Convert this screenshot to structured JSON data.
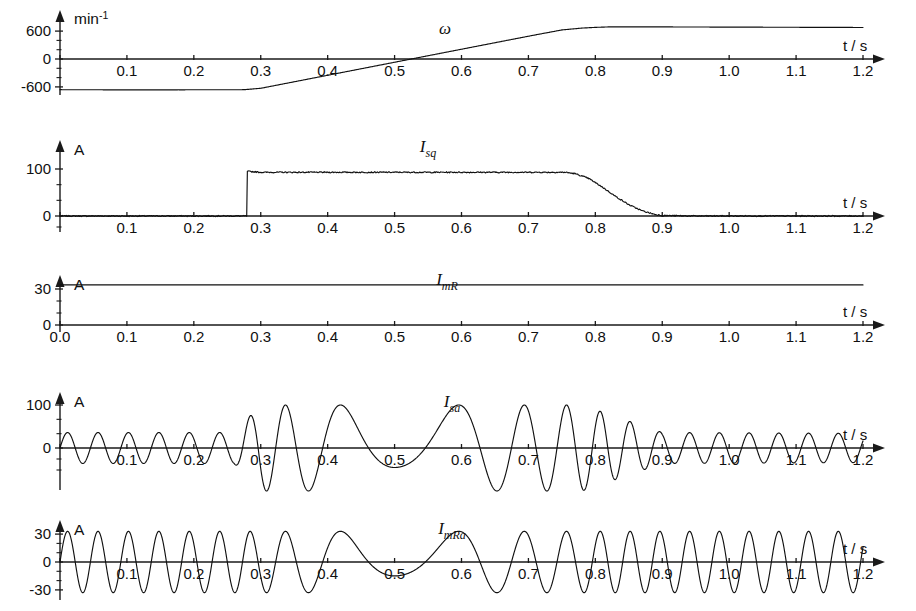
{
  "figure": {
    "background_color": "#ffffff",
    "trace_color": "#111111",
    "axis_color": "#1a1a1a"
  },
  "chart_data": [
    {
      "type": "line",
      "panel_index": 0,
      "name": "speed",
      "curve_label": "ω",
      "title": "",
      "ylabel": "min-1",
      "ylabel_unit": "min",
      "ylabel_exponent": "-1",
      "xlabel": "t / s",
      "xlim": [
        0.0,
        1.2
      ],
      "ylim": [
        -900,
        900
      ],
      "xticks": [
        0.0,
        0.1,
        0.2,
        0.3,
        0.4,
        0.5,
        0.6,
        0.7,
        0.8,
        0.9,
        1.0,
        1.1,
        1.2
      ],
      "xticklabels": [
        "",
        "0.1",
        "0.2",
        "0.3",
        "0.4",
        "0.5",
        "0.6",
        "0.7",
        "0.8",
        "0.9",
        "1.0",
        "1.1",
        "1.2"
      ],
      "yticks": [
        -600,
        0,
        600
      ],
      "yticklabels": [
        "-600",
        "0",
        "600"
      ],
      "grid": false,
      "x": [
        0.0,
        0.05,
        0.1,
        0.15,
        0.2,
        0.25,
        0.275,
        0.3,
        0.35,
        0.4,
        0.45,
        0.5,
        0.55,
        0.6,
        0.65,
        0.7,
        0.75,
        0.78,
        0.8,
        0.82,
        0.85,
        0.9,
        0.95,
        1.0,
        1.05,
        1.1,
        1.15,
        1.2
      ],
      "values": [
        -660,
        -662,
        -663,
        -663,
        -662,
        -661,
        -660,
        -630,
        -490,
        -350,
        -210,
        -70,
        70,
        210,
        350,
        490,
        625,
        665,
        680,
        690,
        692,
        690,
        688,
        686,
        684,
        682,
        680,
        678
      ]
    },
    {
      "type": "line",
      "panel_index": 1,
      "name": "torque-current",
      "curve_label": "Isq",
      "curve_label_main": "I",
      "curve_label_sub": "sq",
      "title": "",
      "ylabel": "A",
      "xlabel": "t / s",
      "xlim": [
        0.0,
        1.2
      ],
      "ylim": [
        -20,
        120
      ],
      "xticks": [
        0.0,
        0.1,
        0.2,
        0.3,
        0.4,
        0.5,
        0.6,
        0.7,
        0.8,
        0.9,
        1.0,
        1.1,
        1.2
      ],
      "xticklabels": [
        "",
        "0.1",
        "0.2",
        "0.3",
        "0.4",
        "0.5",
        "0.6",
        "0.7",
        "0.8",
        "0.9",
        "1.0",
        "1.1",
        "1.2"
      ],
      "yticks": [
        0,
        100
      ],
      "yticklabels": [
        "0",
        "100"
      ],
      "grid": false,
      "x": [
        0.0,
        0.1,
        0.2,
        0.27,
        0.279,
        0.28,
        0.3,
        0.4,
        0.5,
        0.6,
        0.7,
        0.755,
        0.77,
        0.79,
        0.81,
        0.83,
        0.85,
        0.87,
        0.89,
        0.9,
        0.95,
        1.0,
        1.1,
        1.2
      ],
      "values": [
        0,
        0,
        0,
        0,
        0,
        95,
        93,
        93,
        93,
        93,
        93,
        93,
        90,
        80,
        62,
        42,
        24,
        11,
        3,
        1,
        0,
        0,
        0,
        0
      ],
      "noise_amplitude": 2.5,
      "step_time": 0.28,
      "plateau_value": 93,
      "fall_start": 0.76,
      "fall_end": 0.9
    },
    {
      "type": "line",
      "panel_index": 2,
      "name": "magnetising-current",
      "curve_label": "ImR",
      "curve_label_main": "I",
      "curve_label_sub": "mR",
      "title": "",
      "ylabel": "A",
      "xlabel": "t / s",
      "xlim": [
        0.0,
        1.2
      ],
      "ylim": [
        0,
        45
      ],
      "xticks": [
        0.0,
        0.1,
        0.2,
        0.3,
        0.4,
        0.5,
        0.6,
        0.7,
        0.8,
        0.9,
        1.0,
        1.1,
        1.2
      ],
      "xticklabels": [
        "0.0",
        "0.1",
        "0.2",
        "0.3",
        "0.4",
        "0.5",
        "0.6",
        "0.7",
        "0.8",
        "0.9",
        "1.0",
        "1.1",
        "1.2"
      ],
      "yticks": [
        0,
        30
      ],
      "yticklabels": [
        "0",
        "30"
      ],
      "grid": false,
      "x": [
        0.0,
        0.2,
        0.4,
        0.6,
        0.8,
        1.0,
        1.2
      ],
      "values": [
        33.5,
        33.5,
        33.4,
        33.4,
        33.4,
        33.4,
        33.4
      ],
      "constant_value": 33.4
    },
    {
      "type": "line",
      "panel_index": 3,
      "name": "stator-phase-current",
      "curve_label": "Isa",
      "curve_label_main": "I",
      "curve_label_sub": "sa",
      "title": "",
      "ylabel": "A",
      "xlabel": "t / s",
      "xlim": [
        0.0,
        1.2
      ],
      "ylim": [
        -130,
        130
      ],
      "xticks": [
        0.0,
        0.1,
        0.2,
        0.3,
        0.4,
        0.5,
        0.6,
        0.7,
        0.8,
        0.9,
        1.0,
        1.1,
        1.2
      ],
      "xticklabels": [
        "",
        "0.1",
        "0.2",
        "0.3",
        "0.4",
        "0.5",
        "0.6",
        "0.7",
        "0.8",
        "0.9",
        "1.0",
        "1.1",
        "1.2"
      ],
      "yticks": [
        0,
        100
      ],
      "yticklabels": [
        "0",
        "100"
      ],
      "grid": false,
      "waveform": "fm-am-sine",
      "description": "Sinusoidal stator current whose frequency passes through zero near t=0.5 s; amplitude ~35 A before the torque step, ~100 A during acceleration, ~35 A after t=0.9 s",
      "amplitude_breakpoints": [
        {
          "t": 0.0,
          "a": 36
        },
        {
          "t": 0.26,
          "a": 36
        },
        {
          "t": 0.3,
          "a": 100
        },
        {
          "t": 0.78,
          "a": 100
        },
        {
          "t": 0.9,
          "a": 36
        },
        {
          "t": 1.2,
          "a": 34
        }
      ],
      "frequency_breakpoints": [
        {
          "t": 0.0,
          "f": 22.0
        },
        {
          "t": 0.28,
          "f": 22.0
        },
        {
          "t": 0.5,
          "f": 0.0
        },
        {
          "t": 0.82,
          "f": -22.5
        },
        {
          "t": 1.2,
          "f": -22.5
        }
      ]
    },
    {
      "type": "line",
      "panel_index": 4,
      "name": "magnetising-phase-current",
      "curve_label": "ImRa",
      "curve_label_main": "I",
      "curve_label_sub": "mRa",
      "title": "",
      "ylabel": "A",
      "xlabel": "t / s",
      "xlim": [
        0.0,
        1.2
      ],
      "ylim": [
        -45,
        45
      ],
      "xticks": [
        0.0,
        0.1,
        0.2,
        0.3,
        0.4,
        0.5,
        0.6,
        0.7,
        0.8,
        0.9,
        1.0,
        1.1,
        1.2
      ],
      "xticklabels": [
        "",
        "0.1",
        "0.2",
        "0.3",
        "0.4",
        "0.5",
        "0.6",
        "0.7",
        "0.8",
        "0.9",
        "1.0",
        "1.1",
        "1.2"
      ],
      "yticks": [
        -30,
        0,
        30
      ],
      "yticklabels": [
        "-30",
        "0",
        "30"
      ],
      "grid": false,
      "waveform": "fm-sine",
      "description": "Rotor flux phase current, constant amplitude ~33 A, frequency passes through zero near t=0.5 s",
      "amplitude_breakpoints": [
        {
          "t": 0.0,
          "a": 33
        },
        {
          "t": 1.2,
          "a": 33
        }
      ],
      "frequency_breakpoints": [
        {
          "t": 0.0,
          "f": 22.0
        },
        {
          "t": 0.28,
          "f": 22.0
        },
        {
          "t": 0.5,
          "f": 0.0
        },
        {
          "t": 0.82,
          "f": -22.5
        },
        {
          "t": 1.2,
          "f": -22.5
        }
      ]
    }
  ]
}
